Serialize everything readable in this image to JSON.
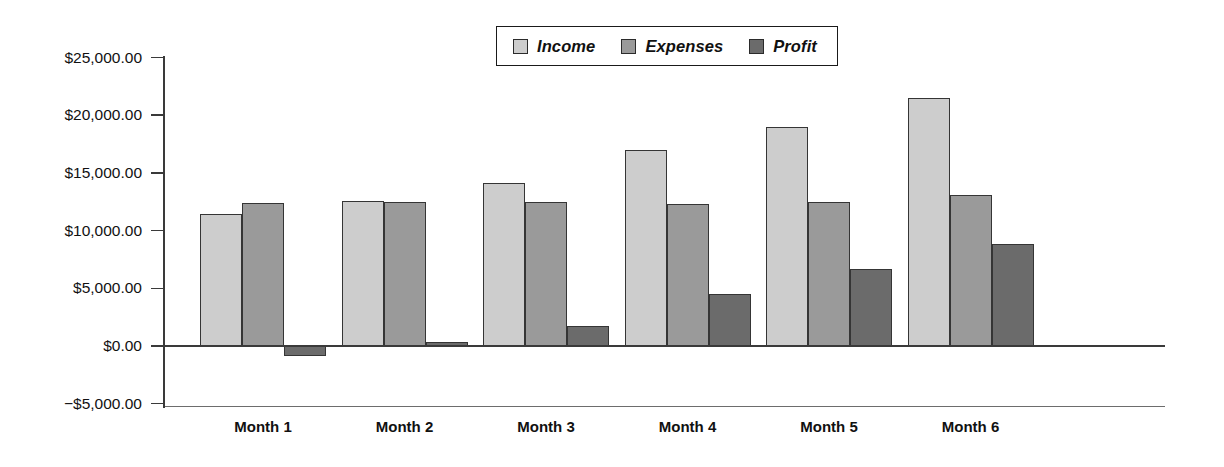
{
  "chart_data": {
    "type": "bar",
    "title": "",
    "subtitle": "",
    "xlabel": "",
    "ylabel": "",
    "categories": [
      "Month 1",
      "Month 2",
      "Month 3",
      "Month 4",
      "Month 5",
      "Month 6"
    ],
    "series": [
      {
        "name": "Income",
        "color": "#cdcdcd",
        "values": [
          11400,
          12550,
          14100,
          16950,
          19000,
          21500
        ]
      },
      {
        "name": "Expenses",
        "color": "#9a9a9a",
        "values": [
          12350,
          12450,
          12450,
          12300,
          12450,
          13100
        ]
      },
      {
        "name": "Profit",
        "color": "#6b6b6b",
        "values": [
          -850,
          350,
          1750,
          4500,
          6700,
          8800
        ]
      }
    ],
    "ylim": [
      -5000,
      25000
    ],
    "ytick_values": [
      25000,
      20000,
      15000,
      10000,
      5000,
      0,
      -5000
    ],
    "ytick_labels": [
      "$25,000.00",
      "$20,000.00",
      "$15,000.00",
      "$10,000.00",
      "$5,000.00",
      "$0.00",
      "−$5,000.00"
    ],
    "grid": false,
    "legend_position": "top-center",
    "legend_entries": [
      "Income",
      "Expenses",
      "Profit"
    ],
    "annotations": []
  },
  "legend": {
    "items": [
      {
        "label": "Income",
        "swatch": "#cdcdcd"
      },
      {
        "label": "Expenses",
        "swatch": "#9a9a9a"
      },
      {
        "label": "Profit",
        "swatch": "#6b6b6b"
      }
    ]
  },
  "axes": {
    "y_labels": [
      "$25,000.00",
      "$20,000.00",
      "$15,000.00",
      "$10,000.00",
      "$5,000.00",
      "$0.00",
      "−$5,000.00"
    ],
    "x_labels": [
      "Month 1",
      "Month 2",
      "Month 3",
      "Month 4",
      "Month 5",
      "Month 6"
    ]
  }
}
